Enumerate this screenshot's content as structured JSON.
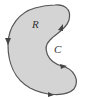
{
  "diagram": {
    "region_label": "R",
    "curve_label": "C",
    "fill_color": "#d4d4d4",
    "stroke_color": "#555555",
    "orientation": "counterclockwise"
  }
}
